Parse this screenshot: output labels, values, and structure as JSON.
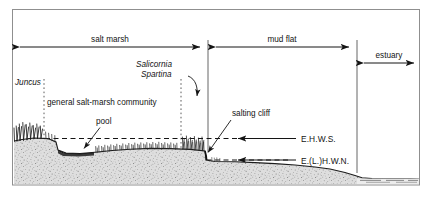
{
  "figure": {
    "frame_color": "#8a8a8a",
    "ink_color": "#141414",
    "ground_fill": "#d9d9d9"
  },
  "zones": [
    {
      "id": "salt-marsh",
      "label": "salt marsh"
    },
    {
      "id": "mud-flat",
      "label": "mud flat"
    },
    {
      "id": "estuary",
      "label": "estuary"
    }
  ],
  "vegetation_labels": [
    {
      "id": "juncus",
      "label": "Juncus",
      "style": "italic"
    },
    {
      "id": "salicornia",
      "label": "Salicornia",
      "style": "italic"
    },
    {
      "id": "spartina",
      "label": "Spartina",
      "style": "italic"
    },
    {
      "id": "general-community",
      "label": "general salt-marsh community",
      "style": "roman"
    }
  ],
  "feature_labels": [
    {
      "id": "pool",
      "label": "pool"
    },
    {
      "id": "salting-cliff",
      "label": "salting cliff"
    }
  ],
  "tide_levels": [
    {
      "id": "ehws",
      "label": "E.H.W.S."
    },
    {
      "id": "elhwn",
      "label": "E.(L.)H.W.N."
    }
  ]
}
